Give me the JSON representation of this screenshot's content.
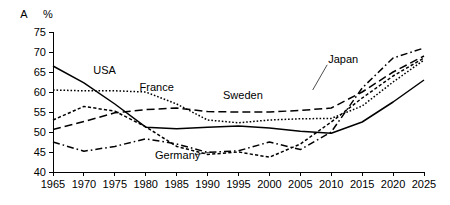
{
  "panel": {
    "label": "A",
    "unit": "%"
  },
  "chart_data": {
    "type": "line",
    "title": "",
    "subtitle": "",
    "xlabel": "",
    "ylabel": "%",
    "panel_label": "A",
    "grid": false,
    "legend_position": "inline-annotations",
    "xlim": [
      1965,
      2025
    ],
    "ylim": [
      40,
      75
    ],
    "xticks": [
      1965,
      1970,
      1975,
      1980,
      1985,
      1990,
      1995,
      2000,
      2005,
      2010,
      2015,
      2020,
      2025
    ],
    "yticks": [
      40,
      45,
      50,
      55,
      60,
      65,
      70,
      75
    ],
    "xtick_labels": [
      "1965",
      "1970",
      "1975",
      "1980",
      "1985",
      "1990",
      "1995",
      "2000",
      "2005",
      "2010",
      "2015",
      "2020",
      "2025"
    ],
    "ytick_labels": [
      "40",
      "45",
      "50",
      "55",
      "60",
      "65",
      "70",
      "75"
    ],
    "x": [
      1965,
      1970,
      1975,
      1980,
      1985,
      1990,
      1995,
      2000,
      2005,
      2010,
      2015,
      2020,
      2025
    ],
    "series": [
      {
        "name": "USA",
        "line_style": "solid",
        "label_x": 1971.5,
        "label_y": 64.6,
        "values": [
          66.5,
          62.3,
          57.0,
          51.2,
          50.8,
          51.2,
          51.5,
          51.0,
          50.2,
          49.7,
          52.5,
          57.5,
          63.0
        ]
      },
      {
        "name": "France",
        "line_style": "dotted",
        "label_x": 1979.0,
        "label_y": 60.2,
        "values": [
          60.5,
          60.3,
          60.3,
          60.0,
          57.0,
          53.0,
          52.3,
          53.0,
          53.3,
          53.4,
          56.5,
          62.5,
          68.0
        ]
      },
      {
        "name": "Germany",
        "line_style": "dashed-short",
        "label_x": 1981.5,
        "label_y": 43.3,
        "values": [
          53.0,
          56.4,
          55.2,
          51.3,
          46.4,
          44.4,
          45.0,
          43.7,
          47.0,
          52.5,
          58.5,
          64.0,
          68.5
        ]
      },
      {
        "name": "Sweden",
        "line_style": "dashed-long",
        "label_x": 1992.5,
        "label_y": 58.3,
        "values": [
          50.6,
          52.6,
          54.8,
          55.6,
          56.0,
          55.1,
          55.0,
          55.0,
          55.4,
          56.0,
          60.0,
          65.0,
          69.0
        ]
      },
      {
        "name": "Japan",
        "line_style": "dashdot",
        "label_x": 2009.5,
        "label_y": 67.3,
        "values": [
          47.5,
          45.2,
          46.4,
          48.3,
          47.0,
          44.9,
          45.3,
          47.5,
          45.6,
          50.0,
          61.0,
          68.5,
          71.0
        ]
      }
    ]
  }
}
